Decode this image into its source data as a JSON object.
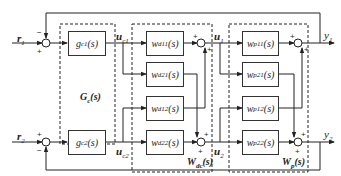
{
  "diagram": {
    "inputs": {
      "r1": "r₁",
      "r2": "r₂"
    },
    "outputs": {
      "y1": "y₁",
      "y2": "y₂"
    },
    "signals": {
      "uc1": "uₑ₁",
      "uc2": "uₑ₂",
      "u1": "u₁",
      "u2": "u₂"
    },
    "signal_text": {
      "uc1": "u",
      "uc1_sub": "c1",
      "uc2": "u",
      "uc2_sub": "c2",
      "u1": "u",
      "u1_sub": "1",
      "u2": "u",
      "u2_sub": "2",
      "r1": "r",
      "r1_sub": "1",
      "r2": "r",
      "r2_sub": "2",
      "y1": "y",
      "y1_sub": "1",
      "y2": "y",
      "y2_sub": "2"
    },
    "controller": {
      "group_label": "G",
      "group_sub": "c",
      "group_suffix": "(s)",
      "blocks": [
        {
          "id": "gc1",
          "name": "g",
          "sub": "c1",
          "suffix": "(s)"
        },
        {
          "id": "gc2",
          "name": "g",
          "sub": "c2",
          "suffix": "(s)"
        }
      ]
    },
    "decoupler": {
      "group_label": "W",
      "group_sub": "dc",
      "group_suffix": "(s)",
      "blocks": [
        {
          "id": "wd11",
          "name": "w",
          "sub": "d11",
          "suffix": "(s)"
        },
        {
          "id": "wd21",
          "name": "w",
          "sub": "d21",
          "suffix": "(s)"
        },
        {
          "id": "wd12",
          "name": "w",
          "sub": "d12",
          "suffix": "(s)"
        },
        {
          "id": "wd22",
          "name": "w",
          "sub": "d22",
          "suffix": "(s)"
        }
      ]
    },
    "plant": {
      "group_label": "W",
      "group_sub": "p",
      "group_suffix": "(s)",
      "blocks": [
        {
          "id": "wp11",
          "name": "w",
          "sub": "p11",
          "suffix": "(s)"
        },
        {
          "id": "wp21",
          "name": "w",
          "sub": "p21",
          "suffix": "(s)"
        },
        {
          "id": "wp12",
          "name": "w",
          "sub": "p12",
          "suffix": "(s)"
        },
        {
          "id": "wp22",
          "name": "w",
          "sub": "p22",
          "suffix": "(s)"
        }
      ]
    },
    "signs": {
      "plus": "+",
      "minus": "−"
    }
  }
}
